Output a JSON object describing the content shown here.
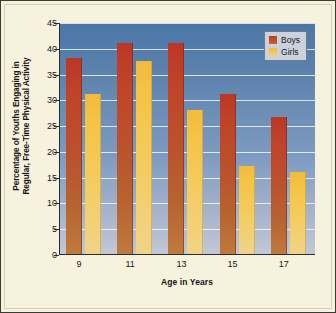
{
  "chart_data": {
    "type": "bar",
    "title": "",
    "xlabel": "Age in Years",
    "ylabel_lines": [
      "Percentage of Youths Engaging in",
      "Regular, Free-Time Physical Activity"
    ],
    "ylabel": "Percentage of Youths Engaging in Regular, Free-Time Physical Activity",
    "categories": [
      "9",
      "11",
      "13",
      "15",
      "17"
    ],
    "series": [
      {
        "name": "Boys",
        "color": "#c03a26",
        "values": [
          38,
          41,
          41,
          31,
          26.5
        ]
      },
      {
        "name": "Girls",
        "color": "#f2bb3c",
        "values": [
          31,
          37.5,
          28,
          17,
          16
        ]
      }
    ],
    "ylim": [
      0,
      45
    ],
    "ytick_labels": [
      "0",
      "5",
      "10",
      "15",
      "20",
      "25",
      "30",
      "35",
      "40",
      "45"
    ],
    "ytick_values": [
      0,
      5,
      10,
      15,
      20,
      25,
      30,
      35,
      40,
      45
    ],
    "grid": true,
    "legend_position": "top-right",
    "plot_background_top_color": "#4a76a6",
    "plot_background_bottom_color": "#c2c8d6",
    "figure_background_color": "#f7f2dd",
    "gridline_color": "#ffffff"
  },
  "legend": {
    "items": [
      {
        "label": "Boys",
        "swatch": "boys-color-swatch"
      },
      {
        "label": "Girls",
        "swatch": "girls-color-swatch"
      }
    ]
  }
}
